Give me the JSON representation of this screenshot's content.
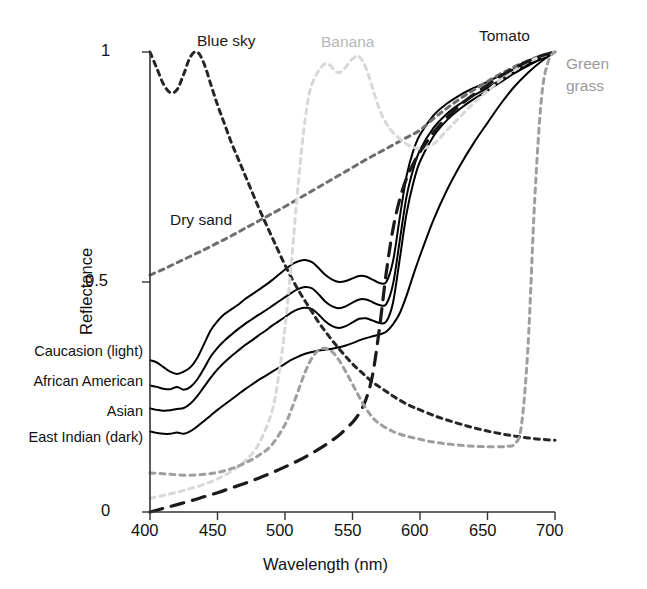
{
  "chart_data": {
    "type": "line",
    "title": "",
    "xlabel": "Wavelength (nm)",
    "ylabel": "Reflectance",
    "xlim": [
      400,
      700
    ],
    "ylim": [
      0,
      1
    ],
    "xticks": [
      400,
      450,
      500,
      550,
      600,
      650,
      700
    ],
    "xtick_labels": [
      "400",
      "450",
      "500",
      "550",
      "600",
      "650",
      "700"
    ],
    "yticks": [
      0,
      0.5,
      1
    ],
    "ytick_labels": [
      "0",
      "0.5",
      "1"
    ],
    "grid": false,
    "legend_position": "inline-annotations",
    "series": [
      {
        "name": "Caucasion (light)",
        "style": "solid",
        "color": "#000000",
        "label_side": "left-axis",
        "x": [
          400,
          405,
          410,
          415,
          420,
          425,
          430,
          435,
          440,
          445,
          450,
          455,
          460,
          465,
          470,
          475,
          480,
          485,
          490,
          495,
          500,
          505,
          510,
          515,
          520,
          525,
          530,
          535,
          540,
          545,
          550,
          555,
          560,
          565,
          570,
          575,
          580,
          585,
          590,
          595,
          600,
          610,
          620,
          630,
          640,
          650,
          660,
          670,
          680,
          690,
          700
        ],
        "y": [
          0.33,
          0.325,
          0.315,
          0.305,
          0.3,
          0.305,
          0.315,
          0.335,
          0.365,
          0.395,
          0.415,
          0.43,
          0.44,
          0.45,
          0.462,
          0.472,
          0.482,
          0.492,
          0.503,
          0.515,
          0.527,
          0.538,
          0.545,
          0.548,
          0.543,
          0.53,
          0.515,
          0.505,
          0.5,
          0.502,
          0.508,
          0.513,
          0.512,
          0.505,
          0.498,
          0.5,
          0.545,
          0.64,
          0.73,
          0.785,
          0.82,
          0.862,
          0.888,
          0.907,
          0.922,
          0.935,
          0.95,
          0.963,
          0.975,
          0.988,
          1.0
        ]
      },
      {
        "name": "African American",
        "style": "solid",
        "color": "#000000",
        "label_side": "left-axis",
        "x": [
          400,
          405,
          410,
          415,
          420,
          425,
          430,
          435,
          440,
          445,
          450,
          455,
          460,
          465,
          470,
          475,
          480,
          485,
          490,
          495,
          500,
          505,
          510,
          515,
          520,
          525,
          530,
          535,
          540,
          545,
          550,
          555,
          560,
          565,
          570,
          575,
          580,
          585,
          590,
          595,
          600,
          610,
          620,
          630,
          640,
          650,
          660,
          670,
          680,
          690,
          700
        ],
        "y": [
          0.275,
          0.272,
          0.268,
          0.267,
          0.272,
          0.266,
          0.272,
          0.288,
          0.312,
          0.338,
          0.357,
          0.372,
          0.385,
          0.397,
          0.408,
          0.418,
          0.428,
          0.437,
          0.447,
          0.457,
          0.467,
          0.477,
          0.485,
          0.489,
          0.486,
          0.473,
          0.457,
          0.447,
          0.443,
          0.447,
          0.455,
          0.462,
          0.462,
          0.456,
          0.45,
          0.452,
          0.495,
          0.59,
          0.685,
          0.745,
          0.787,
          0.835,
          0.866,
          0.888,
          0.906,
          0.922,
          0.94,
          0.957,
          0.972,
          0.986,
          1.0
        ]
      },
      {
        "name": "Asian",
        "style": "solid",
        "color": "#000000",
        "label_side": "left-axis",
        "x": [
          400,
          405,
          410,
          415,
          420,
          425,
          430,
          435,
          440,
          445,
          450,
          455,
          460,
          465,
          470,
          475,
          480,
          485,
          490,
          495,
          500,
          505,
          510,
          515,
          520,
          525,
          530,
          535,
          540,
          545,
          550,
          555,
          560,
          565,
          570,
          575,
          580,
          585,
          590,
          595,
          600,
          610,
          620,
          630,
          640,
          650,
          660,
          670,
          680,
          690,
          700
        ],
        "y": [
          0.225,
          0.222,
          0.22,
          0.221,
          0.224,
          0.226,
          0.236,
          0.252,
          0.272,
          0.292,
          0.31,
          0.325,
          0.338,
          0.35,
          0.362,
          0.372,
          0.383,
          0.393,
          0.404,
          0.414,
          0.424,
          0.434,
          0.441,
          0.444,
          0.441,
          0.429,
          0.414,
          0.404,
          0.4,
          0.404,
          0.412,
          0.42,
          0.421,
          0.416,
          0.411,
          0.414,
          0.455,
          0.55,
          0.648,
          0.715,
          0.762,
          0.817,
          0.852,
          0.877,
          0.898,
          0.916,
          0.935,
          0.954,
          0.97,
          0.985,
          1.0
        ]
      },
      {
        "name": "East Indian (dark)",
        "style": "solid",
        "color": "#000000",
        "label_side": "left-axis",
        "x": [
          400,
          405,
          410,
          415,
          420,
          425,
          430,
          435,
          440,
          445,
          450,
          455,
          460,
          465,
          470,
          475,
          480,
          485,
          490,
          495,
          500,
          505,
          510,
          515,
          520,
          525,
          530,
          535,
          540,
          545,
          550,
          555,
          560,
          565,
          570,
          575,
          580,
          585,
          590,
          595,
          600,
          610,
          620,
          630,
          640,
          650,
          660,
          670,
          680,
          690,
          700
        ],
        "y": [
          0.175,
          0.172,
          0.17,
          0.17,
          0.173,
          0.17,
          0.176,
          0.186,
          0.198,
          0.21,
          0.222,
          0.233,
          0.244,
          0.255,
          0.266,
          0.276,
          0.286,
          0.295,
          0.304,
          0.313,
          0.322,
          0.331,
          0.338,
          0.344,
          0.348,
          0.351,
          0.353,
          0.355,
          0.358,
          0.362,
          0.367,
          0.373,
          0.378,
          0.382,
          0.386,
          0.392,
          0.408,
          0.432,
          0.47,
          0.515,
          0.557,
          0.635,
          0.7,
          0.755,
          0.803,
          0.846,
          0.888,
          0.925,
          0.955,
          0.98,
          1.0
        ]
      },
      {
        "name": "Blue sky",
        "style": "dotted",
        "color": "#262626",
        "label_position": {
          "x": 195,
          "y": 33
        },
        "x": [
          400,
          405,
          410,
          415,
          420,
          425,
          430,
          435,
          440,
          445,
          450,
          455,
          460,
          465,
          470,
          475,
          480,
          485,
          490,
          495,
          500,
          505,
          510,
          515,
          520,
          525,
          530,
          535,
          540,
          545,
          550,
          555,
          560,
          565,
          570,
          575,
          580,
          585,
          590,
          595,
          600,
          610,
          620,
          630,
          640,
          650,
          660,
          670,
          680,
          690,
          700
        ],
        "y": [
          1.0,
          0.965,
          0.93,
          0.912,
          0.918,
          0.952,
          0.99,
          1.0,
          0.975,
          0.93,
          0.885,
          0.845,
          0.805,
          0.77,
          0.735,
          0.7,
          0.665,
          0.632,
          0.6,
          0.568,
          0.537,
          0.508,
          0.482,
          0.458,
          0.435,
          0.412,
          0.392,
          0.373,
          0.355,
          0.338,
          0.322,
          0.308,
          0.295,
          0.282,
          0.272,
          0.262,
          0.252,
          0.243,
          0.235,
          0.228,
          0.222,
          0.21,
          0.2,
          0.191,
          0.183,
          0.176,
          0.17,
          0.165,
          0.161,
          0.158,
          0.156
        ]
      },
      {
        "name": "Dry sand",
        "style": "dotted",
        "color": "#6e6e6e",
        "label_position": {
          "x": 170,
          "y": 212
        },
        "x": [
          400,
          410,
          420,
          430,
          440,
          450,
          460,
          470,
          480,
          490,
          500,
          510,
          520,
          530,
          540,
          550,
          560,
          570,
          580,
          590,
          600,
          610,
          620,
          630,
          640,
          650,
          660,
          670,
          680,
          690,
          700
        ],
        "y": [
          0.515,
          0.528,
          0.542,
          0.556,
          0.57,
          0.585,
          0.6,
          0.616,
          0.632,
          0.648,
          0.664,
          0.681,
          0.698,
          0.715,
          0.732,
          0.749,
          0.766,
          0.782,
          0.798,
          0.814,
          0.83,
          0.855,
          0.878,
          0.899,
          0.918,
          0.936,
          0.953,
          0.968,
          0.981,
          0.992,
          1.0
        ]
      },
      {
        "name": "Banana",
        "style": "dotted",
        "color": "#d8d8d8",
        "label_position": {
          "x": 322,
          "y": 33
        },
        "x": [
          400,
          410,
          420,
          430,
          440,
          450,
          460,
          470,
          480,
          490,
          495,
          500,
          505,
          510,
          515,
          520,
          530,
          540,
          550,
          555,
          560,
          565,
          570,
          575,
          580,
          590,
          600,
          610,
          620,
          630,
          640,
          650,
          660,
          670,
          680,
          690,
          700
        ],
        "y": [
          0.03,
          0.036,
          0.043,
          0.051,
          0.06,
          0.072,
          0.088,
          0.11,
          0.145,
          0.215,
          0.29,
          0.4,
          0.55,
          0.72,
          0.855,
          0.93,
          0.975,
          0.955,
          0.985,
          0.99,
          0.965,
          0.92,
          0.875,
          0.845,
          0.825,
          0.8,
          0.79,
          0.8,
          0.83,
          0.86,
          0.89,
          0.915,
          0.94,
          0.96,
          0.978,
          0.99,
          1.0
        ]
      },
      {
        "name": "Tomato",
        "style": "dashed",
        "color": "#1a1a1a",
        "label_position": {
          "x": 478,
          "y": 28
        },
        "x": [
          400,
          410,
          420,
          430,
          440,
          450,
          460,
          470,
          480,
          490,
          500,
          510,
          520,
          530,
          540,
          550,
          555,
          560,
          565,
          570,
          575,
          580,
          585,
          590,
          595,
          600,
          610,
          620,
          630,
          640,
          650,
          660,
          670,
          680,
          690,
          700
        ],
        "y": [
          0.0,
          0.008,
          0.016,
          0.024,
          0.033,
          0.042,
          0.052,
          0.062,
          0.073,
          0.085,
          0.098,
          0.112,
          0.128,
          0.146,
          0.167,
          0.195,
          0.215,
          0.245,
          0.3,
          0.4,
          0.52,
          0.615,
          0.68,
          0.725,
          0.757,
          0.783,
          0.825,
          0.858,
          0.885,
          0.908,
          0.928,
          0.948,
          0.965,
          0.98,
          0.992,
          1.0
        ]
      },
      {
        "name": "Green grass",
        "style": "dotted",
        "color": "#9e9e9e",
        "label_position": {
          "x": 566,
          "y": 56
        },
        "x": [
          400,
          410,
          420,
          430,
          440,
          450,
          460,
          470,
          480,
          490,
          500,
          505,
          510,
          515,
          520,
          525,
          530,
          535,
          540,
          545,
          550,
          555,
          560,
          565,
          570,
          580,
          590,
          600,
          610,
          620,
          630,
          640,
          650,
          660,
          665,
          670,
          675,
          680,
          685,
          690,
          695,
          700
        ],
        "y": [
          0.085,
          0.083,
          0.081,
          0.08,
          0.082,
          0.086,
          0.094,
          0.106,
          0.122,
          0.145,
          0.19,
          0.225,
          0.265,
          0.305,
          0.335,
          0.352,
          0.356,
          0.348,
          0.33,
          0.305,
          0.278,
          0.25,
          0.225,
          0.205,
          0.192,
          0.175,
          0.165,
          0.158,
          0.152,
          0.148,
          0.145,
          0.143,
          0.142,
          0.142,
          0.143,
          0.148,
          0.185,
          0.36,
          0.68,
          0.9,
          0.98,
          1.0
        ]
      }
    ],
    "annotations": [
      {
        "text": "Blue sky",
        "tone": "dark"
      },
      {
        "text": "Dry sand",
        "tone": "dark"
      },
      {
        "text": "Banana",
        "tone": "light"
      },
      {
        "text": "Tomato",
        "tone": "dark"
      },
      {
        "text": "Green grass",
        "tone": "midgray"
      }
    ]
  },
  "axis": {
    "x_title": "Wavelength (nm)",
    "y_title": "Reflectance",
    "x_ticks": [
      "400",
      "450",
      "500",
      "550",
      "600",
      "650",
      "700"
    ],
    "y_ticks": [
      "1",
      "0.5",
      "0"
    ]
  },
  "series_axis_labels": [
    "Caucasion (light)",
    "African American",
    "Asian",
    "East Indian (dark)"
  ],
  "annotation_labels": {
    "blue_sky": "Blue sky",
    "dry_sand": "Dry sand",
    "banana": "Banana",
    "tomato": "Tomato",
    "green_grass_line1": "Green",
    "green_grass_line2": "grass"
  },
  "colors": {
    "axis": "#333333",
    "solid_curve": "#000000",
    "blue_sky": "#262626",
    "dry_sand": "#6e6e6e",
    "banana": "#d8d8d8",
    "tomato": "#1a1a1a",
    "green_grass": "#9e9e9e",
    "text": "#111111",
    "background": "#ffffff"
  }
}
